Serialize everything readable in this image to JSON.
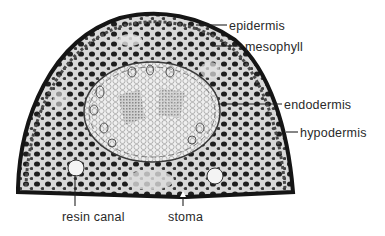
{
  "diagram": {
    "labels": [
      {
        "id": "epidermis",
        "text": "epidermis",
        "x": 229,
        "y": 19
      },
      {
        "id": "mesophyll",
        "text": "mesophyll",
        "x": 245,
        "y": 40
      },
      {
        "id": "endodermis",
        "text": "endodermis",
        "x": 284,
        "y": 98
      },
      {
        "id": "hypodermis",
        "text": "hypodermis",
        "x": 300,
        "y": 126
      },
      {
        "id": "resin-canal",
        "text": "resin canal",
        "x": 62,
        "y": 213
      },
      {
        "id": "stoma",
        "text": "stoma",
        "x": 170,
        "y": 213
      }
    ],
    "leader_lines": [
      {
        "label": "epidermis",
        "x1": 196,
        "y1": 25,
        "x2": 227,
        "y2": 25
      },
      {
        "label": "mesophyll",
        "x1": 212,
        "y1": 46,
        "x2": 243,
        "y2": 46
      },
      {
        "label": "endodermis",
        "x1": 218,
        "y1": 104,
        "x2": 282,
        "y2": 104
      },
      {
        "label": "hypodermis",
        "x1": 286,
        "y1": 132,
        "x2": 298,
        "y2": 132
      },
      {
        "label": "resin-canal",
        "x1": 75,
        "y1": 175,
        "x2": 75,
        "y2": 206
      },
      {
        "label": "stoma",
        "x1": 183,
        "y1": 197,
        "x2": 183,
        "y2": 206
      }
    ],
    "colors": {
      "background": "#ffffff",
      "tissue_dark": "#1c1c1c",
      "tissue_mid": "#6a6a6a",
      "tissue_light": "#e6e6e6",
      "label_text": "#2a2a2a"
    }
  }
}
